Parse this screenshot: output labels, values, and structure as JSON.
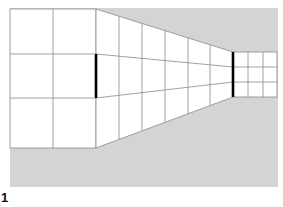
{
  "figure": {
    "label": "1",
    "colors": {
      "background": "#d4d4d4",
      "wall": "#ffffff",
      "grid_line": "#8a8a8a",
      "bar": "#000000"
    },
    "left_bar": {
      "x": 96,
      "y1": 54,
      "y2": 98
    },
    "right_bar": {
      "x": 233,
      "y1": 52,
      "y2": 97
    }
  }
}
